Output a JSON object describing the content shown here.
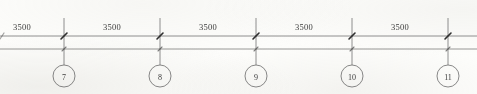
{
  "drawing": {
    "type": "grid-dimension-line",
    "title": "Structural grid dimension strip",
    "units_note": "",
    "geometry": {
      "width": 477,
      "height": 94,
      "dim_line_y": 36,
      "base_line_y": 49,
      "bubble_cy": 76,
      "bubble_r": 11,
      "line_color": "#6f6f6f",
      "text_color": "#3c3c3c",
      "paper_color": "#fdfdfb"
    },
    "grid_lines": [
      {
        "id": "grid-7",
        "label": "7",
        "x": 64
      },
      {
        "id": "grid-8",
        "label": "8",
        "x": 160
      },
      {
        "id": "grid-9",
        "label": "9",
        "x": 256
      },
      {
        "id": "grid-10",
        "label": "10",
        "x": 352
      },
      {
        "id": "grid-11",
        "label": "11",
        "x": 448
      }
    ],
    "dimensions": [
      {
        "id": "dim-0",
        "value": "3500",
        "x": 22,
        "from": "edge",
        "to": "grid-7"
      },
      {
        "id": "dim-1",
        "value": "3500",
        "x": 112,
        "from": "grid-7",
        "to": "grid-8"
      },
      {
        "id": "dim-2",
        "value": "3500",
        "x": 208,
        "from": "grid-8",
        "to": "grid-9"
      },
      {
        "id": "dim-3",
        "value": "3500",
        "x": 304,
        "from": "grid-9",
        "to": "grid-10"
      },
      {
        "id": "dim-4",
        "value": "3500",
        "x": 400,
        "from": "grid-10",
        "to": "grid-11"
      }
    ],
    "dim_label_y": 22
  }
}
